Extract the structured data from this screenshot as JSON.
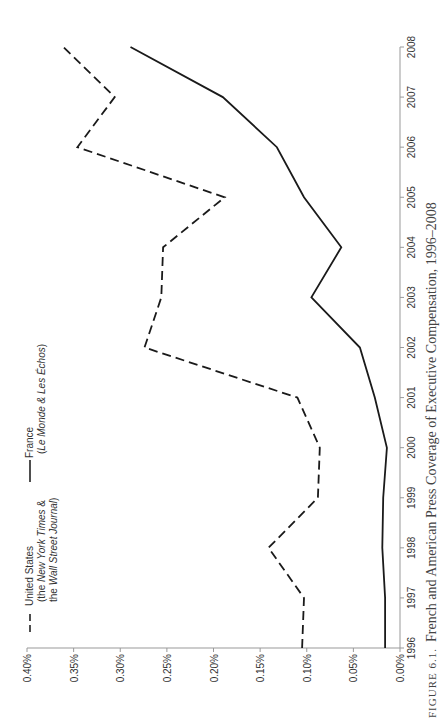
{
  "chart_data": {
    "type": "line",
    "orientation": "rotated-90-ccw",
    "title": "",
    "caption": "FIGURE 6.1. French and American Press Coverage of Executive Compensation, 1996–2008",
    "caption_prefix": "FIGURE 6.1.",
    "caption_text": "French and American Press Coverage of Executive Compensation, 1996–2008",
    "xlabel": "",
    "ylabel": "",
    "x": [
      1996,
      1997,
      1998,
      1999,
      2000,
      2001,
      2002,
      2003,
      2004,
      2005,
      2006,
      2007,
      2008
    ],
    "x_ticks": [
      "1996",
      "1997",
      "1998",
      "1999",
      "2000",
      "2001",
      "2002",
      "2003",
      "2004",
      "2005",
      "2006",
      "2007",
      "2008"
    ],
    "y_ticks": [
      "0.00%",
      "0.05%",
      "0.10%",
      "0.15%",
      "0.20%",
      "0.25%",
      "0.30%",
      "0.35%",
      "0.40%"
    ],
    "ylim": [
      0,
      0.4
    ],
    "grid": false,
    "legend_position": "top-left",
    "series": [
      {
        "name": "United States (the New York Times & the Wall Street Journal)",
        "style": "dashed",
        "values": [
          0.105,
          0.103,
          0.141,
          0.088,
          0.086,
          0.11,
          0.274,
          0.256,
          0.254,
          0.188,
          0.346,
          0.306,
          0.361
        ]
      },
      {
        "name": "France (Le Monde & Les Échos)",
        "style": "solid",
        "values": [
          0.016,
          0.016,
          0.019,
          0.018,
          0.014,
          0.027,
          0.043,
          0.095,
          0.063,
          0.103,
          0.132,
          0.19,
          0.289
        ]
      }
    ]
  },
  "legend": {
    "us": {
      "line1": "United States",
      "line2_pre": "(the ",
      "line2_em": "New York Times",
      "line2_post": " &",
      "line3_pre": "the ",
      "line3_em": "Wall Street Journal",
      "line3_post": ")"
    },
    "fr": {
      "line1": "France",
      "line2_pre": "(",
      "line2_em": "Le Monde & Les Échos",
      "line2_post": ")"
    }
  }
}
